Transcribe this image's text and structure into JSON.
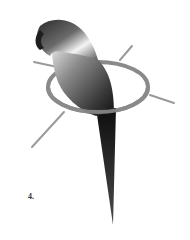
{
  "figure": {
    "label": "4.",
    "colors": {
      "ring": "#8a8a8a",
      "lines": "#9a9a9a",
      "body_dark": "#1a1a1a",
      "body_light": "#f2f2f2",
      "background": "#ffffff"
    }
  }
}
